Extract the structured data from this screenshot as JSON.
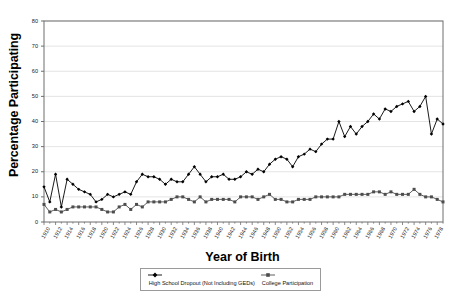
{
  "chart_data": {
    "type": "line",
    "title": "",
    "xlabel": "Year of Birth",
    "ylabel": "Percentage Participating",
    "ylim": [
      0,
      80
    ],
    "ytick_step": 10,
    "yticks": [
      0,
      10,
      20,
      30,
      40,
      50,
      60,
      70,
      80
    ],
    "xlim": [
      1910,
      1979
    ],
    "xtick_step": 2,
    "grid": "horizontal",
    "legend_position": "bottom",
    "x": [
      1910,
      1911,
      1912,
      1913,
      1914,
      1915,
      1916,
      1917,
      1918,
      1919,
      1920,
      1921,
      1922,
      1923,
      1924,
      1925,
      1926,
      1927,
      1928,
      1929,
      1930,
      1931,
      1932,
      1933,
      1934,
      1935,
      1936,
      1937,
      1938,
      1939,
      1940,
      1941,
      1942,
      1943,
      1944,
      1945,
      1946,
      1947,
      1948,
      1949,
      1950,
      1951,
      1952,
      1953,
      1954,
      1955,
      1956,
      1957,
      1958,
      1959,
      1960,
      1961,
      1962,
      1963,
      1964,
      1965,
      1966,
      1967,
      1968,
      1969,
      1970,
      1971,
      1972,
      1973,
      1974,
      1975,
      1976,
      1977,
      1978,
      1979
    ],
    "xtick_labels": [
      "1910",
      "1912",
      "1914",
      "1916",
      "1918",
      "1920",
      "1922",
      "1924",
      "1926",
      "1928",
      "1930",
      "1932",
      "1934",
      "1936",
      "1938",
      "1940",
      "1942",
      "1944",
      "1946",
      "1948",
      "1950",
      "1952",
      "1954",
      "1956",
      "1958",
      "1960",
      "1962",
      "1964",
      "1966",
      "1968",
      "1970",
      "1972",
      "1974",
      "1976",
      "1978"
    ],
    "series": [
      {
        "name": "High School Dropout (Not Including GEDs)",
        "marker": "diamond",
        "color": "#000000",
        "values": [
          14,
          8,
          19,
          6,
          17,
          15,
          13,
          12,
          11,
          8,
          9,
          11,
          10,
          11,
          12,
          11,
          16,
          19,
          18,
          18,
          17,
          15,
          17,
          16,
          16,
          19,
          22,
          19,
          16,
          18,
          18,
          19,
          17,
          17,
          18,
          20,
          19,
          21,
          20,
          23,
          25,
          26,
          25,
          22,
          26,
          27,
          29,
          28,
          31,
          33,
          33,
          40,
          34,
          38,
          35,
          38,
          40,
          43,
          41,
          45,
          44,
          46,
          47,
          48,
          44,
          46,
          50,
          35,
          41,
          39
        ]
      },
      {
        "name": "College Participation",
        "marker": "square",
        "color": "#4d4d4d",
        "values": [
          7,
          4,
          5,
          4,
          5,
          6,
          6,
          6,
          6,
          6,
          5,
          4,
          4,
          6,
          7,
          5,
          7,
          6,
          8,
          8,
          8,
          8,
          9,
          10,
          10,
          9,
          8,
          10,
          8,
          9,
          9,
          9,
          9,
          8,
          10,
          10,
          10,
          9,
          10,
          11,
          9,
          9,
          8,
          8,
          9,
          9,
          9,
          10,
          10,
          10,
          10,
          10,
          11,
          11,
          11,
          11,
          11,
          12,
          12,
          11,
          12,
          11,
          11,
          11,
          13,
          11,
          10,
          10,
          9,
          8
        ]
      }
    ]
  },
  "legend": {
    "entries": [
      {
        "label": "High School Dropout (Not Including GEDs)"
      },
      {
        "label": "College Participation"
      }
    ]
  }
}
